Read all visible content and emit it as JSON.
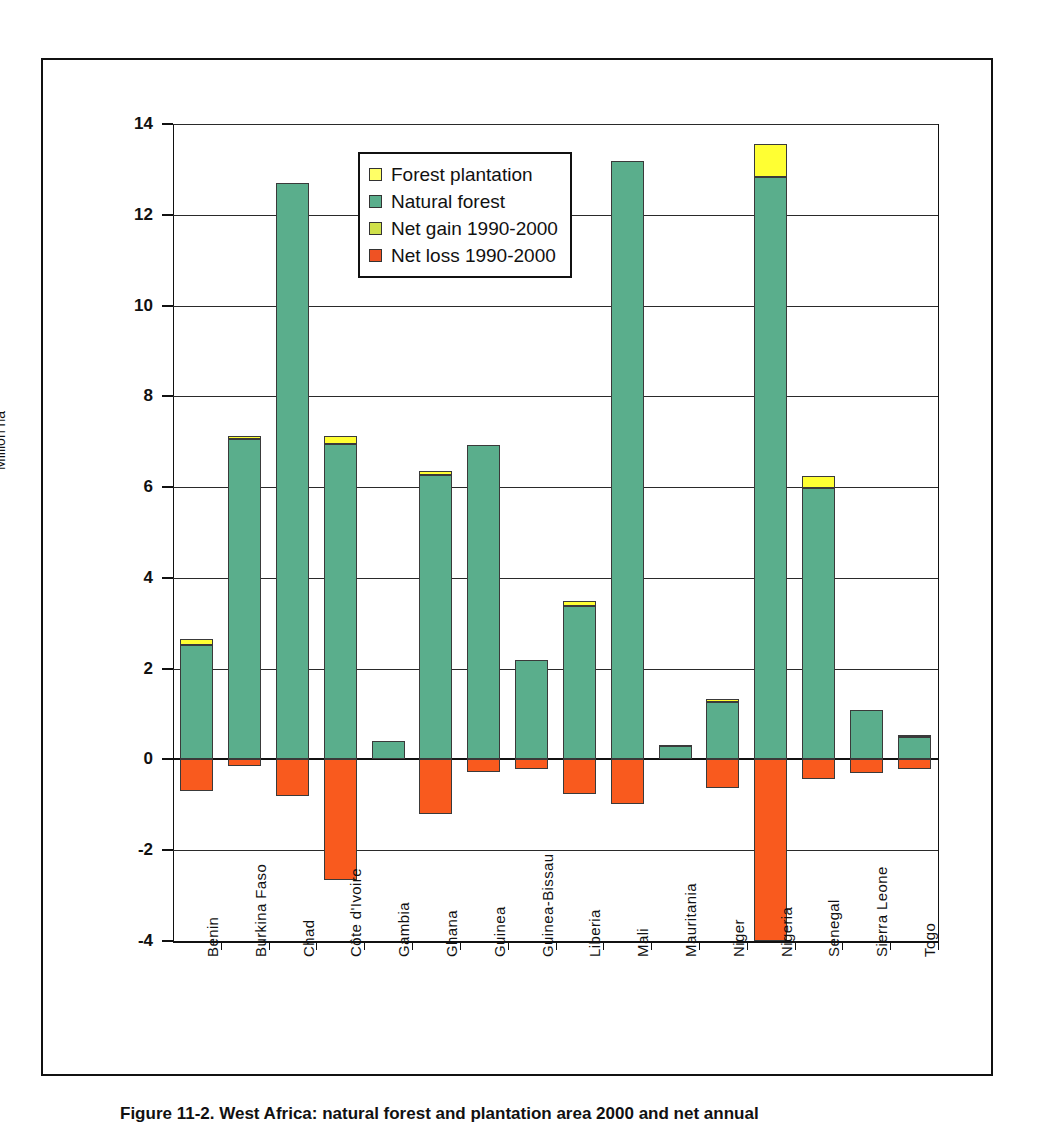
{
  "caption": "Figure 11-2. West Africa: natural forest and plantation area 2000 and net annual",
  "chart_data": {
    "type": "bar",
    "title": "",
    "subtitle": "",
    "xlabel": "",
    "ylabel": "Million ha",
    "ylim": [
      -4,
      14
    ],
    "yticks": [
      -4,
      -2,
      0,
      2,
      4,
      6,
      8,
      10,
      12,
      14
    ],
    "ytick_labels": [
      "-4",
      "-2",
      "0",
      "2",
      "4",
      "6",
      "8",
      "10",
      "12",
      "14"
    ],
    "grid": true,
    "stacked": true,
    "legend_position": "inside-upper-left",
    "categories": [
      "Benin",
      "Burkina Faso",
      "Chad",
      "Côte d'Ivoire",
      "Gambia",
      "Ghana",
      "Guinea",
      "Guinea-Bissau",
      "Liberia",
      "Mali",
      "Mauritania",
      "Niger",
      "Nigeria",
      "Senegal",
      "Sierra Leone",
      "Togo"
    ],
    "series": [
      {
        "name": "Forest plantation",
        "color": "#ffff33",
        "values": [
          0.12,
          0.07,
          0.0,
          0.18,
          0.0,
          0.08,
          0.0,
          0.0,
          0.12,
          0.0,
          0.03,
          0.07,
          0.73,
          0.26,
          0.0,
          0.04
        ]
      },
      {
        "name": "Natural forest",
        "color": "#5aae8c",
        "values": [
          2.53,
          7.05,
          12.69,
          6.94,
          0.4,
          6.27,
          6.93,
          2.2,
          3.37,
          13.18,
          0.29,
          1.27,
          12.84,
          5.98,
          1.08,
          0.5
        ]
      },
      {
        "name": "Net gain 1990-2000",
        "color": "#d7e24a",
        "values": [
          0.0,
          0.0,
          0.0,
          0.0,
          0.0,
          0.0,
          0.0,
          0.0,
          0.0,
          0.0,
          0.0,
          0.0,
          0.0,
          0.0,
          0.0,
          0.0
        ]
      },
      {
        "name": "Net loss 1990-2000",
        "color": "#f95a1e",
        "values": [
          -0.7,
          -0.14,
          -0.8,
          -2.65,
          0.0,
          -1.2,
          -0.27,
          -0.2,
          -0.76,
          -0.99,
          0.0,
          -0.62,
          -4.0,
          -0.44,
          -0.29,
          -0.21
        ]
      }
    ],
    "legend": [
      {
        "label": "Forest plantation",
        "color": "#ffff66"
      },
      {
        "label": "Natural forest",
        "color": "#5aae8c"
      },
      {
        "label": "Net gain 1990-2000",
        "color": "#cfe04a"
      },
      {
        "label": "Net loss 1990-2000",
        "color": "#ef5223"
      }
    ]
  }
}
